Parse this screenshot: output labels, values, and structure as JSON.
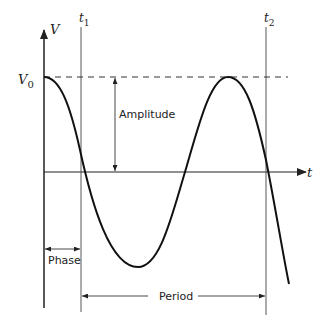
{
  "diagram": {
    "type": "sine-wave-annotation",
    "axes": {
      "y_label": "V",
      "x_label": "t"
    },
    "markers": {
      "v0_label": "V",
      "v0_subscript": "0",
      "t1_label": "t",
      "t1_subscript": "1",
      "t2_label": "t",
      "t2_subscript": "2"
    },
    "annotations": {
      "amplitude": "Amplitude",
      "phase": "Phase",
      "period": "Period"
    },
    "colors": {
      "stroke": "#222222",
      "background": "#ffffff"
    }
  }
}
